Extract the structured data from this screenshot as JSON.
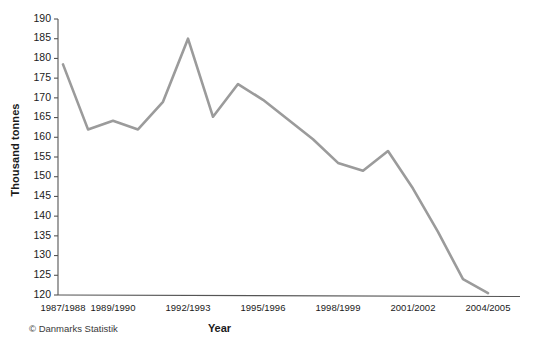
{
  "chart_data": {
    "type": "line",
    "title": "",
    "subtitle": "",
    "xlabel": "Year",
    "ylabel": "Thousand tonnes",
    "ylim": [
      120,
      190
    ],
    "ytick_step": 5,
    "yticks": [
      120,
      125,
      130,
      135,
      140,
      145,
      150,
      155,
      160,
      165,
      170,
      175,
      180,
      185,
      190
    ],
    "ytick_labels": [
      "120",
      "125",
      "130",
      "135",
      "140",
      "145",
      "150",
      "155",
      "160",
      "165",
      "170",
      "175",
      "180",
      "185",
      "190"
    ],
    "grid": false,
    "legend": null,
    "legend_position": "none",
    "line_color": "#9b9b9b",
    "axis_color": "#555555",
    "categories": [
      "1987/1988",
      "1988/1989",
      "1989/1990",
      "1990/1991",
      "1991/1992",
      "1992/1993",
      "1993/1994",
      "1994/1995",
      "1995/1996",
      "1996/1997",
      "1997/1998",
      "1998/1999",
      "1999/2000",
      "2000/2001",
      "2001/2002",
      "2002/2003",
      "2003/2004",
      "2004/2005"
    ],
    "xtick_labels": [
      "1987/1988",
      "1989/1990",
      "1992/1993",
      "1995/1996",
      "1998/1999",
      "2001/2002",
      "2004/2005"
    ],
    "xtick_categories": [
      "1987/1988",
      "1989/1990",
      "1992/1993",
      "1995/1996",
      "1998/1999",
      "2001/2002",
      "2004/2005"
    ],
    "values": [
      178.5,
      162.0,
      164.2,
      162.0,
      169.0,
      185.0,
      165.2,
      173.5,
      169.5,
      164.5,
      159.5,
      153.5,
      151.5,
      156.5,
      147.0,
      136.0,
      124.0,
      120.5
    ],
    "values_tail_note": "",
    "series": [
      {
        "name": "Thousand tonnes",
        "color": "#9b9b9b",
        "values": [
          178.5,
          162.0,
          164.2,
          162.0,
          169.0,
          185.0,
          165.2,
          173.5,
          169.5,
          164.5,
          159.5,
          153.5,
          151.5,
          156.5,
          147.0,
          136.0,
          124.0,
          120.5
        ]
      }
    ]
  },
  "axes": {
    "y_title": "Thousand tonnes",
    "x_title": "Year"
  },
  "footer": {
    "source": "© Danmarks Statistik"
  }
}
